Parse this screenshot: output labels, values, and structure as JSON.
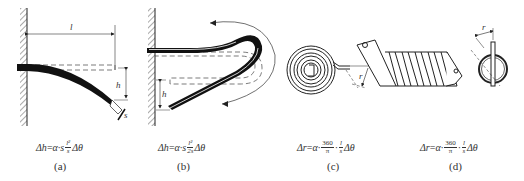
{
  "figure": {
    "panels": [
      {
        "id": "a",
        "caption": "(a)",
        "description": "cantilever bimetal strip",
        "labels": {
          "length": "l",
          "deflection": "h",
          "thickness": "s"
        },
        "formula": {
          "lhs": "Δh",
          "eq": "=",
          "coef": "α·s",
          "frac_num": "l²",
          "frac_den": "s",
          "tail": "Δθ"
        }
      },
      {
        "id": "b",
        "caption": "(b)",
        "description": "U-shaped bimetal strip",
        "labels": {
          "deflection": "h"
        },
        "formula": {
          "lhs": "Δh",
          "eq": "=",
          "coef": "α·s",
          "frac_num": "l²",
          "frac_den": "2s",
          "tail": "Δθ"
        }
      },
      {
        "id": "c",
        "caption": "(c)",
        "description": "flat spiral bimetal",
        "labels": {
          "radius": "r"
        },
        "formula": {
          "lhs": "Δr",
          "eq": "=",
          "coef": "α·",
          "frac1_num": "360",
          "frac1_den": "π",
          "dot": "·",
          "frac2_num": "l",
          "frac2_den": "s",
          "tail": "Δθ"
        }
      },
      {
        "id": "d",
        "caption": "(d)",
        "description": "helical bimetal",
        "labels": {
          "radius": "r"
        },
        "formula": {
          "lhs": "Δr",
          "eq": "=",
          "coef": "α·",
          "frac1_num": "360",
          "frac1_den": "π",
          "dot": "·",
          "frac2_num": "l",
          "frac2_den": "s",
          "tail": "Δθ"
        }
      }
    ],
    "colors": {
      "ink": "#1a1a1a",
      "hatch": "#555555",
      "dash": "#444444",
      "background": "#ffffff"
    }
  }
}
